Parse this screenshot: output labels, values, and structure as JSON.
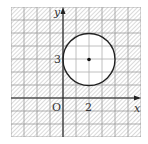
{
  "diagram": {
    "type": "coordinate-plane-region",
    "grid": {
      "x_min": -4,
      "x_max": 6,
      "y_min": -3,
      "y_max": 7,
      "unit_px": 13
    },
    "axes": {
      "x_label": "x",
      "y_label": "y",
      "origin_label": "O"
    },
    "tick_labels": {
      "x": "2",
      "y": "3"
    },
    "circle": {
      "center": [
        2,
        3
      ],
      "radius": 2,
      "center_dot": true
    },
    "shading": "outside circle (hatched)",
    "colors": {
      "grid": "#9a9a9a",
      "hatch": "#b5b5b5",
      "stroke": "#222222",
      "fill_inside": "#ffffff"
    }
  }
}
